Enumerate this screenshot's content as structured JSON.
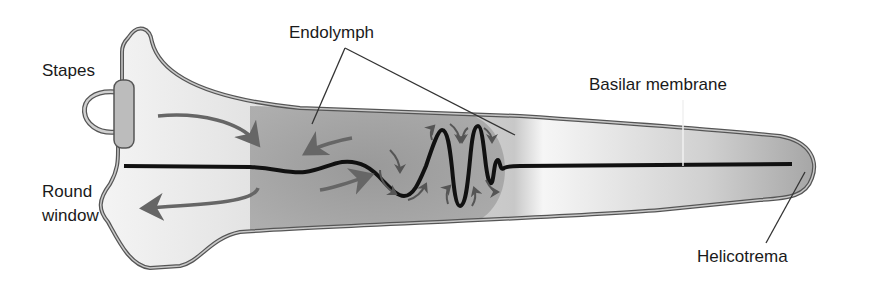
{
  "diagram": {
    "labels": {
      "stapes": "Stapes",
      "round_window_line1": "Round",
      "round_window_line2": "window",
      "endolymph": "Endolymph",
      "basilar_membrane": "Basilar membrane",
      "helicotrema": "Helicotrema"
    },
    "colors": {
      "outline": "#5a5a5a",
      "wall_fill": "#b8b8b8",
      "fluid_light": "#f2f2f2",
      "fluid_mid": "#d4d4d4",
      "fluid_dark": "#a8a8a8",
      "wave_zone": "#9a9a9a",
      "membrane": "#111111",
      "arrow": "#666666",
      "leader": "#333333"
    }
  }
}
